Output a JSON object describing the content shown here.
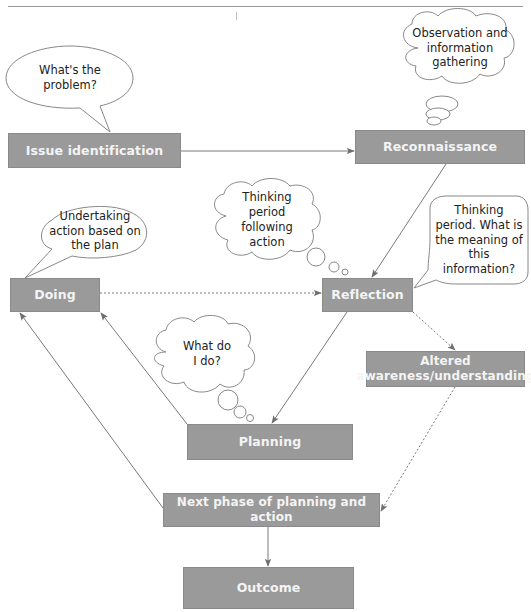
{
  "figure": {
    "type": "flow-diagram",
    "caption_visible": false,
    "colors": {
      "box_fill": "#9a9a9a",
      "box_text": "#f4f4f4",
      "line": "#777777",
      "note_text": "#222222"
    }
  },
  "boxes": {
    "issue_identification": "Issue identification",
    "reconnaissance": "Reconnaissance",
    "doing": "Doing",
    "reflection": "Reflection",
    "altered_awareness": "Altered awareness/understanding",
    "planning": "Planning",
    "next_phase": "Next phase of planning and action",
    "outcome": "Outcome"
  },
  "notes": {
    "whats_the_problem": {
      "shape": "speech-bubble",
      "text": "What's the\nproblem?"
    },
    "observation": {
      "shape": "thought-cloud",
      "text": "Observation and\ninformation\ngathering"
    },
    "undertaking_action": {
      "shape": "speech-bubble",
      "text": "Undertaking\naction based on\nthe plan"
    },
    "thinking_following_action": {
      "shape": "thought-cloud",
      "text": "Thinking\nperiod\nfollowing\naction"
    },
    "thinking_meaning": {
      "shape": "speech-bubble",
      "text": "Thinking\nperiod. What is\nthe meaning of\nthis\ninformation?"
    },
    "what_do_i_do": {
      "shape": "thought-cloud",
      "text": "What do\nI do?"
    }
  },
  "connections": [
    {
      "from": "Issue identification",
      "to": "Reconnaissance",
      "style": "solid"
    },
    {
      "from": "Reconnaissance",
      "to": "Reflection",
      "style": "solid"
    },
    {
      "from": "Doing",
      "to": "Reflection",
      "style": "dotted"
    },
    {
      "from": "Reflection",
      "to": "Planning",
      "style": "solid"
    },
    {
      "from": "Reflection",
      "to": "Altered awareness/understanding",
      "style": "dotted"
    },
    {
      "from": "Planning",
      "to": "Doing",
      "style": "solid"
    },
    {
      "from": "Altered awareness/understanding",
      "to": "Next phase of planning and action",
      "style": "dotted"
    },
    {
      "from": "Next phase of planning and action",
      "to": "Doing",
      "style": "solid"
    },
    {
      "from": "Next phase of planning and action",
      "to": "Outcome",
      "style": "solid"
    }
  ]
}
